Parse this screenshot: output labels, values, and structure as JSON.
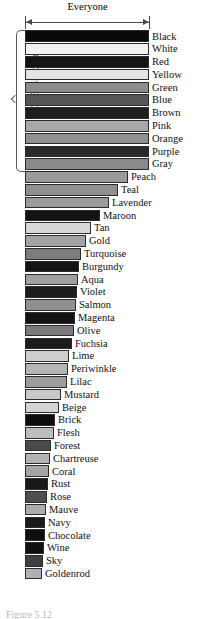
{
  "figure": {
    "span_label": "Everyone",
    "bracket_label": "11 Basic colors",
    "caption": "Figure 5.12"
  },
  "chart_data": {
    "type": "bar",
    "orientation": "horizontal",
    "title": "Everyone",
    "subtitle": "11 Basic colors",
    "xlabel": "",
    "ylabel": "",
    "grid": false,
    "legend": false,
    "axis_max": 124,
    "note": "Bar length encodes relative agreement/frequency for each color name; value is bar width in pixels from the common left baseline.",
    "categories": [
      "Black",
      "White",
      "Red",
      "Yellow",
      "Green",
      "Blue",
      "Brown",
      "Pink",
      "Orange",
      "Purple",
      "Gray",
      "Peach",
      "Teal",
      "Lavender",
      "Maroon",
      "Tan",
      "Gold",
      "Turquoise",
      "Burgundy",
      "Aqua",
      "Violet",
      "Salmon",
      "Magenta",
      "Olive",
      "Fuchsia",
      "Lime",
      "Periwinkle",
      "Lilac",
      "Mustard",
      "Beige",
      "Brick",
      "Flesh",
      "Forest",
      "Chartreuse",
      "Coral",
      "Rust",
      "Rose",
      "Mauve",
      "Navy",
      "Chocolate",
      "Wine",
      "Sky",
      "Goldenrod"
    ],
    "values": [
      124,
      124,
      124,
      124,
      124,
      124,
      124,
      124,
      124,
      124,
      124,
      103,
      93,
      84,
      75,
      66,
      61,
      56,
      54,
      53,
      52,
      51,
      50,
      49,
      47,
      44,
      43,
      42,
      36,
      34,
      30,
      29,
      26,
      25,
      24,
      23,
      22,
      21,
      20,
      20,
      19,
      18,
      17
    ],
    "shades": [
      "#0a0a0a",
      "#f2f2f2",
      "#141414",
      "#e3e3e3",
      "#8c8c8c",
      "#555555",
      "#1e1e1e",
      "#a8a8a8",
      "#8f8f8f",
      "#2a2a2a",
      "#8a8a8a",
      "#9a9a9a",
      "#8f8f8f",
      "#9a9a9a",
      "#131313",
      "#d8d8d8",
      "#a3a3a3",
      "#7d7d7d",
      "#151515",
      "#a0a0a0",
      "#1d1d1d",
      "#909090",
      "#121212",
      "#7a7a7a",
      "#1c1c1c",
      "#cfcfcf",
      "#b4b4b4",
      "#9d9d9d",
      "#c9c9c9",
      "#d4d4d4",
      "#0d0d0d",
      "#bdbdbd",
      "#4a4a4a",
      "#b3b3b3",
      "#a5a5a5",
      "#181818",
      "#4f4f4f",
      "#acacac",
      "#1a1a1a",
      "#0f0f0f",
      "#101010",
      "#3f3f3f",
      "#b0b0b0"
    ],
    "bracketed_count": 11
  }
}
